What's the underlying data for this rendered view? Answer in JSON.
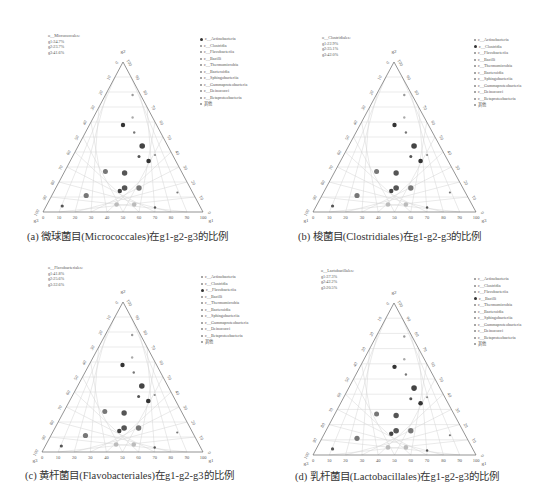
{
  "legend_items": [
    "c__Actinobacteria",
    "c__Clostridia",
    "c__Flavobacteriia",
    "c__Bacilli",
    "c__Thermomicrobia",
    "c__Bacteroidia",
    "c__Sphingobacteriia",
    "c__Gammaproteobacteria",
    "c__Deinococci",
    "c__Betaproteobacteria",
    "其他"
  ],
  "panels": [
    {
      "id": "a",
      "caption": "(a) 微球菌目(Micrococcales)在g1-g2-g3的比例",
      "order": "o__Micrococcales:",
      "g1": "g1:34.7%",
      "g2": "g2:23.7%",
      "g3": "g3:41.6%",
      "highlight": 0,
      "corners": {
        "top": "g2",
        "left": "g3",
        "right": "g1"
      }
    },
    {
      "id": "b",
      "caption": "(b) 梭菌目(Clostridiales)在g1-g2-g3的比例",
      "order": "o__Clostridiales:",
      "g1": "g1:22.9%",
      "g2": "g2:35.1%",
      "g3": "g3:42.0%",
      "highlight": 1,
      "corners": {
        "top": "g2",
        "left": "g1",
        "right": "g3"
      }
    },
    {
      "id": "c",
      "caption": "(c) 黄杆菌目(Flavobacteriales)在g1-g2-g3的比例",
      "order": "o__Flavobacteriales:",
      "g1": "g1:41.8%",
      "g2": "g2:25.6%",
      "g3": "g3:32.6%",
      "highlight": 2,
      "corners": {
        "top": "g2",
        "left": "g3",
        "right": "g1"
      }
    },
    {
      "id": "d",
      "caption": "(d) 乳杆菌目(Lactobacillales)在g1-g2-g3的比例",
      "order": "o__Lactobacillales:",
      "g1": "g1:37.3%",
      "g2": "g2:42.2%",
      "g3": "g3:20.5%",
      "highlight": 3,
      "corners": {
        "top": "g2",
        "left": "g3",
        "right": "g1"
      }
    }
  ],
  "chart_data": [
    {
      "type": "scatter",
      "subtype": "ternary",
      "title": "(a) 微球菌目(Micrococcales)在g1-g2-g3的比例",
      "axes": [
        "g1",
        "g2",
        "g3"
      ],
      "ticks": [
        0,
        10,
        20,
        30,
        40,
        50,
        60,
        70,
        80,
        90,
        100
      ],
      "annotation": [
        "o__Micrococcales:",
        "g1:34.7%",
        "g2:23.7%",
        "g3:41.6%"
      ],
      "legend": [
        "c__Actinobacteria",
        "c__Clostridia",
        "c__Flavobacteriia",
        "c__Bacilli",
        "c__Thermomicrobia",
        "c__Bacteroidia",
        "c__Sphingobacteriia",
        "c__Gammaproteobacteria",
        "c__Deinococci",
        "c__Betaproteobacteria",
        "其他"
      ],
      "legend_position": "right"
    },
    {
      "type": "scatter",
      "subtype": "ternary",
      "title": "(b) 梭菌目(Clostridiales)在g1-g2-g3的比例",
      "axes": [
        "g1",
        "g2",
        "g3"
      ],
      "ticks": [
        0,
        10,
        20,
        30,
        40,
        50,
        60,
        70,
        80,
        90,
        100
      ],
      "annotation": [
        "o__Clostridiales:",
        "g1:22.9%",
        "g2:35.1%",
        "g3:42.0%"
      ],
      "legend_position": "right"
    },
    {
      "type": "scatter",
      "subtype": "ternary",
      "title": "(c) 黄杆菌目(Flavobacteriales)在g1-g2-g3的比例",
      "axes": [
        "g1",
        "g2",
        "g3"
      ],
      "ticks": [
        0,
        10,
        20,
        30,
        40,
        50,
        60,
        70,
        80,
        90,
        100
      ],
      "annotation": [
        "o__Flavobacteriales:",
        "g1:41.8%",
        "g2:25.6%",
        "g3:32.6%"
      ],
      "legend_position": "right"
    },
    {
      "type": "scatter",
      "subtype": "ternary",
      "title": "(d) 乳杆菌目(Lactobacillales)在g1-g2-g3的比例",
      "axes": [
        "g1",
        "g2",
        "g3"
      ],
      "ticks": [
        0,
        10,
        20,
        30,
        40,
        50,
        60,
        70,
        80,
        90,
        100
      ],
      "annotation": [
        "o__Lactobacillales:",
        "g1:37.3%",
        "g2:42.2%",
        "g3:20.5%"
      ],
      "legend_position": "right"
    }
  ],
  "points": [
    {
      "bx": 0.56,
      "h": 0.78,
      "r": 1.2,
      "c": "#999"
    },
    {
      "bx": 0.56,
      "h": 0.63,
      "r": 1.2,
      "c": "#aaa"
    },
    {
      "bx": 0.5,
      "h": 0.58,
      "r": 2.2,
      "c": "#333"
    },
    {
      "bx": 0.57,
      "h": 0.53,
      "r": 1.2,
      "c": "#777"
    },
    {
      "bx": 0.62,
      "h": 0.44,
      "r": 2.8,
      "c": "#444"
    },
    {
      "bx": 0.6,
      "h": 0.37,
      "r": 1.5,
      "c": "#555"
    },
    {
      "bx": 0.66,
      "h": 0.34,
      "r": 2.3,
      "c": "#333"
    },
    {
      "bx": 0.7,
      "h": 0.38,
      "r": 1.1,
      "c": "#888"
    },
    {
      "bx": 0.39,
      "h": 0.27,
      "r": 2.5,
      "c": "#777"
    },
    {
      "bx": 0.51,
      "h": 0.26,
      "r": 2.7,
      "c": "#555"
    },
    {
      "bx": 0.48,
      "h": 0.14,
      "r": 2.2,
      "c": "#444"
    },
    {
      "bx": 0.51,
      "h": 0.16,
      "r": 2.8,
      "c": "#555"
    },
    {
      "bx": 0.6,
      "h": 0.16,
      "r": 2.7,
      "c": "#777"
    },
    {
      "bx": 0.84,
      "h": 0.13,
      "r": 1.1,
      "c": "#777"
    },
    {
      "bx": 0.27,
      "h": 0.11,
      "r": 2.6,
      "c": "#777"
    },
    {
      "bx": 0.46,
      "h": 0.05,
      "r": 2.3,
      "c": "#bbb"
    },
    {
      "bx": 0.57,
      "h": 0.05,
      "r": 2.3,
      "c": "#bbb"
    },
    {
      "bx": 0.12,
      "h": 0.04,
      "r": 1.6,
      "c": "#555"
    },
    {
      "bx": 0.7,
      "h": 0.03,
      "r": 1.2,
      "c": "#555"
    }
  ]
}
